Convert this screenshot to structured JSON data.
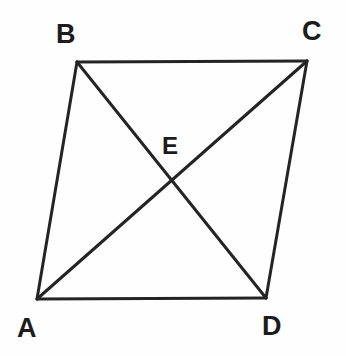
{
  "figure": {
    "kind": "geometry-diagram",
    "canvas": {
      "width": 346,
      "height": 356
    },
    "background_color": "#fefefe",
    "stroke_color": "#242424",
    "label_color": "#1c1c1c",
    "stroke_width": 3
  },
  "vertices": [
    {
      "id": "A",
      "label": "A",
      "x": 37,
      "y": 299,
      "label_x": 17,
      "label_y": 315
    },
    {
      "id": "B",
      "label": "B",
      "x": 77,
      "y": 62,
      "label_x": 56,
      "label_y": 21
    },
    {
      "id": "C",
      "label": "C",
      "x": 307,
      "y": 61,
      "label_x": 302,
      "label_y": 18
    },
    {
      "id": "D",
      "label": "D",
      "x": 266,
      "y": 298,
      "label_x": 262,
      "label_y": 313
    },
    {
      "id": "E",
      "label": "E",
      "x": 172,
      "y": 182,
      "label_x": 162,
      "label_y": 134
    }
  ],
  "edges": [
    {
      "id": "AB",
      "from": "A",
      "to": "B",
      "role": "side",
      "x1": 37,
      "y1": 299,
      "x2": 77,
      "y2": 62
    },
    {
      "id": "BC",
      "from": "B",
      "to": "C",
      "role": "side",
      "x1": 77,
      "y1": 62,
      "x2": 307,
      "y2": 61
    },
    {
      "id": "CD",
      "from": "C",
      "to": "D",
      "role": "side",
      "x1": 307,
      "y1": 61,
      "x2": 266,
      "y2": 298
    },
    {
      "id": "DA",
      "from": "D",
      "to": "A",
      "role": "side",
      "x1": 266,
      "y1": 298,
      "x2": 37,
      "y2": 299
    },
    {
      "id": "AC",
      "from": "A",
      "to": "C",
      "role": "diagonal",
      "x1": 37,
      "y1": 299,
      "x2": 307,
      "y2": 61
    },
    {
      "id": "BD",
      "from": "B",
      "to": "D",
      "role": "diagonal",
      "x1": 77,
      "y1": 62,
      "x2": 266,
      "y2": 298
    }
  ],
  "intersection": {
    "id": "E",
    "label": "E",
    "x": 172,
    "y": 182
  }
}
